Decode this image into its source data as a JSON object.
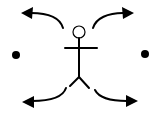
{
  "diagram": {
    "colors": {
      "background": "#ffffff",
      "ink": "#000000"
    },
    "figure": {
      "label": ""
    },
    "arrows": [
      {
        "id": "up-left",
        "direction": "up-left"
      },
      {
        "id": "up-right",
        "direction": "up-right"
      },
      {
        "id": "down-left",
        "direction": "down-left"
      },
      {
        "id": "down-right",
        "direction": "down-right"
      }
    ],
    "dots": [
      {
        "id": "left",
        "position": "left"
      },
      {
        "id": "right",
        "position": "right"
      }
    ]
  }
}
